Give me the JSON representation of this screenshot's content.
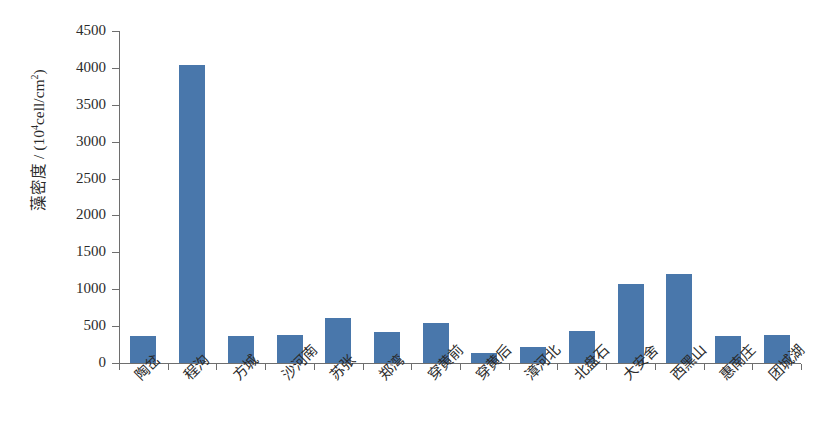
{
  "chart_data": {
    "type": "bar",
    "title": "",
    "subtitle": "",
    "xlabel": "",
    "ylabel": "藻密度 / (10⁴cell/cm²)",
    "ylabel_parts": {
      "prefix": "藻密度 / (10",
      "exponent": "4",
      "suffix": "cell/cm",
      "exponent2": "2",
      "close": ")"
    },
    "categories": [
      "陶岔",
      "程沟",
      "方城",
      "沙河南",
      "苏张",
      "郑湾",
      "穿黄前",
      "穿黄后",
      "漳河北",
      "北盘石",
      "大安舍",
      "西黑山",
      "惠南庄",
      "团城湖"
    ],
    "values": [
      365,
      4040,
      365,
      385,
      610,
      415,
      545,
      130,
      215,
      430,
      1070,
      1200,
      360,
      385
    ],
    "ylim": [
      0,
      4500
    ],
    "y_ticks": [
      0,
      500,
      1000,
      1500,
      2000,
      2500,
      3000,
      3500,
      4000,
      4500
    ],
    "y_tick_labels": [
      "0",
      "500",
      "1000",
      "1500",
      "2000",
      "2500",
      "3000",
      "3500",
      "4000",
      "4500"
    ],
    "grid": false,
    "legend": null,
    "legend_position": "none",
    "bar_color": "#4977ab",
    "axis_color": "#6e6e6e",
    "background_color": "#ffffff",
    "series": [
      {
        "name": "藻密度",
        "values": [
          365,
          4040,
          365,
          385,
          610,
          415,
          545,
          130,
          215,
          430,
          1070,
          1200,
          360,
          385
        ]
      }
    ]
  }
}
